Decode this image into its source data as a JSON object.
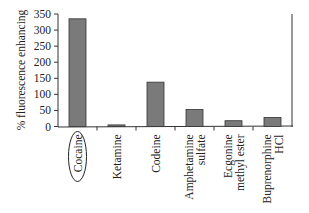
{
  "chart_data": {
    "type": "bar",
    "title": "",
    "xlabel": "",
    "ylabel": "% fluorescence enhancing",
    "ylim": [
      0,
      350
    ],
    "yticks": [
      0,
      50,
      100,
      150,
      200,
      250,
      300,
      350
    ],
    "grid": false,
    "legend": "none",
    "categories": [
      {
        "lines": [
          "Cocaine"
        ],
        "circled": true
      },
      {
        "lines": [
          "Ketamine"
        ],
        "circled": false
      },
      {
        "lines": [
          "Codeine"
        ],
        "circled": false
      },
      {
        "lines": [
          "Amphetamine",
          "sulfate"
        ],
        "circled": false
      },
      {
        "lines": [
          "Ecgonine",
          "methyl ester"
        ],
        "circled": false
      },
      {
        "lines": [
          "Buprenorphine",
          "HCl"
        ],
        "circled": false
      }
    ],
    "values": [
      335,
      5,
      138,
      53,
      18,
      28
    ],
    "bar_color": "#7a7a7a",
    "bar_edge_color": "#333333"
  }
}
